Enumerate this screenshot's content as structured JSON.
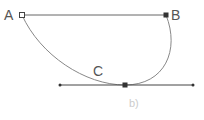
{
  "figure": {
    "caption": "b)",
    "colors": {
      "line": "#555555",
      "curve": "#888888",
      "marker": "#333333",
      "caption": "#cccccc",
      "label": "#555555"
    },
    "points": [
      {
        "label": "A",
        "x": 22,
        "y": 15,
        "marker": "hollow-square"
      },
      {
        "label": "B",
        "x": 166,
        "y": 15,
        "marker": "filled-square"
      },
      {
        "label": "C",
        "x": 125,
        "y": 85,
        "marker": "filled-square"
      }
    ],
    "segments": [
      {
        "name": "AB",
        "from": "A",
        "to": "B"
      },
      {
        "name": "tangent-line",
        "x1": 60,
        "x2": 193,
        "y": 85
      }
    ],
    "curve": {
      "name": "curve-ACB",
      "through": [
        "A",
        "C",
        "B"
      ]
    }
  }
}
